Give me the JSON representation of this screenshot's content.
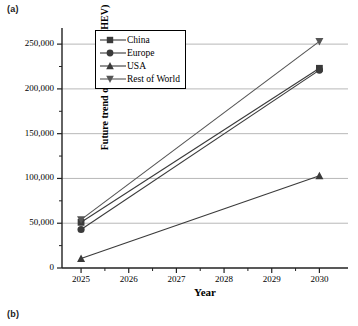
{
  "figure": {
    "panel_a_label": "(a)",
    "panel_b_label": "(b)"
  },
  "chart_data": {
    "type": "line",
    "title": "",
    "xlabel": "Year",
    "ylabel": "Future trend of van stock (PHEV)",
    "x": [
      2025,
      2030
    ],
    "xlim": [
      2024.6,
      2030.6
    ],
    "ylim": [
      0,
      268000
    ],
    "xticks": [
      2025,
      2026,
      2027,
      2028,
      2029,
      2030
    ],
    "xticklabels": [
      "2025",
      "2026",
      "2027",
      "2028",
      "2029",
      "2030"
    ],
    "yticks": [
      0,
      50000,
      100000,
      150000,
      200000,
      250000
    ],
    "yticklabels": [
      "0",
      "50,000",
      "100,000",
      "150,000",
      "200,000",
      "250,000"
    ],
    "grid": "horizontal-major",
    "legend_position": "upper-left-inside",
    "series": [
      {
        "name": "China",
        "marker": "square",
        "color": "#3a3a3a",
        "values": [
          51000,
          223000
        ]
      },
      {
        "name": "Europe",
        "marker": "circle",
        "color": "#3a3a3a",
        "values": [
          43000,
          221000
        ]
      },
      {
        "name": "USA",
        "marker": "triangle-up",
        "color": "#3a3a3a",
        "values": [
          10500,
          103000
        ]
      },
      {
        "name": "Rest of World",
        "marker": "triangle-down",
        "color": "#555555",
        "values": [
          54000,
          253000
        ]
      }
    ]
  }
}
